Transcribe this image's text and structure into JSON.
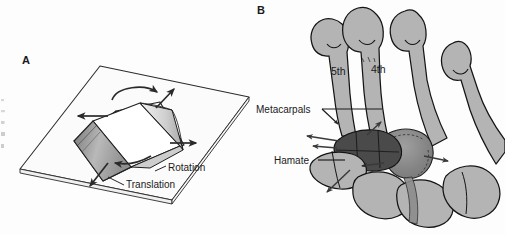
{
  "figure": {
    "background_color": "#fdfdfd",
    "panels": [
      {
        "letter": "A",
        "name": "rigid-body-motion-diagram",
        "description": "Book resting on a flat plane illustrating rotation and translation",
        "annotations": [
          {
            "label": "Rotation",
            "name": "rotation-label"
          },
          {
            "label": "Translation",
            "name": "translation-label"
          }
        ]
      },
      {
        "letter": "B",
        "name": "hand-skeleton-diagram",
        "description": "Dorsal view of carpometacarpal joints of the hand",
        "annotations": [
          {
            "label": "Metacarpals",
            "name": "metacarpals-label"
          },
          {
            "label": "Hamate",
            "name": "hamate-label"
          }
        ],
        "digit_labels": [
          {
            "label": "5th",
            "name": "fifth-digit-label"
          },
          {
            "label": "4th",
            "name": "fourth-digit-label"
          }
        ]
      }
    ],
    "edge_fragments": [
      "—",
      "·",
      "▫",
      "▪",
      "▪",
      "▫"
    ],
    "colors": {
      "outline": "#1a1a1a",
      "bone_fill": "#b4b4b4",
      "bone_fill_light": "#c4c4c4",
      "hamate_dark": "#4a4a4a",
      "carpal_mid": "#8d8d8d",
      "plane_fill": "#fbfbfb",
      "book_cover": "#fefefe",
      "book_pages": "#d8d8d8",
      "book_shadow": "#8a8a8a",
      "arrow": "#2a2a2a",
      "text": "#1a1a1a"
    }
  }
}
